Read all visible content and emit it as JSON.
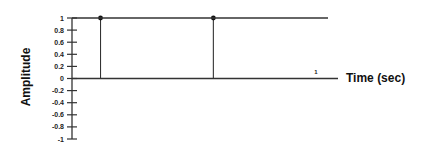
{
  "chart_data": {
    "type": "stem",
    "title": "",
    "xlabel": "Time (sec)",
    "ylabel": "Amplitude",
    "ylim": [
      -1,
      1
    ],
    "xlim": [
      0,
      1.09
    ],
    "yticks": [
      1,
      0.8,
      0.6,
      0.4,
      0.2,
      0,
      -0.2,
      -0.4,
      -0.6,
      -0.8,
      -1
    ],
    "ytick_labels": [
      "1",
      "0.8",
      "0.6",
      "0.4",
      "0.2",
      "0",
      "-0.2",
      "-0.4",
      "-0.6",
      "-0.8",
      "-1"
    ],
    "xticks": [
      1
    ],
    "xtick_labels": [
      "1"
    ],
    "grid": false,
    "legend": "none",
    "series": [
      {
        "name": "impulses",
        "type": "stem",
        "x": [
          0.115,
          0.57
        ],
        "y": [
          1,
          1
        ]
      },
      {
        "name": "level",
        "type": "line",
        "x": [
          0,
          1.0
        ],
        "y": [
          1,
          1
        ]
      }
    ],
    "colors": {
      "stem": "#333333",
      "axis": "#333333",
      "marker": "#111111"
    }
  }
}
